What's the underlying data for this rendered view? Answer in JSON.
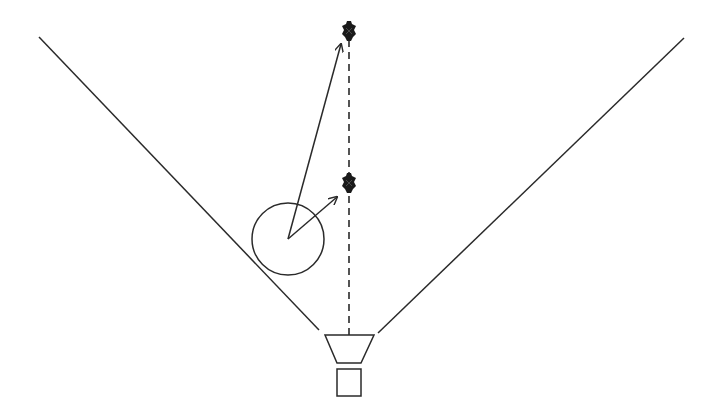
{
  "diagram": {
    "colors": {
      "stroke": "#2a2a2a",
      "marker": "#1a1a1a",
      "background": "#ffffff"
    },
    "fov_lines": [
      {
        "name": "left-fov-boundary",
        "x1": 39,
        "y1": 37,
        "x2": 319,
        "y2": 330
      },
      {
        "name": "right-fov-boundary",
        "x1": 684,
        "y1": 38,
        "x2": 378,
        "y2": 333
      }
    ],
    "optical_axis": {
      "x1": 349,
      "y1": 40,
      "x2": 349,
      "y2": 337
    },
    "targets": [
      {
        "name": "far-target",
        "x": 349,
        "y": 31
      },
      {
        "name": "near-target",
        "x": 349,
        "y": 183
      }
    ],
    "object_circle": {
      "cx": 288,
      "cy": 239,
      "r": 36
    },
    "vectors": [
      {
        "name": "vector-to-far-target",
        "x1": 288,
        "y1": 239,
        "x2": 341,
        "y2": 44
      },
      {
        "name": "vector-to-near-target",
        "x1": 288,
        "y1": 239,
        "x2": 337,
        "y2": 197
      }
    ],
    "camera": {
      "lens": {
        "top_left": [
          325,
          335
        ],
        "top_right": [
          374,
          335
        ],
        "bottom_right": [
          361,
          363
        ],
        "bottom_left": [
          337,
          363
        ]
      },
      "body": {
        "x": 337,
        "y": 369,
        "w": 24,
        "h": 27
      }
    }
  }
}
